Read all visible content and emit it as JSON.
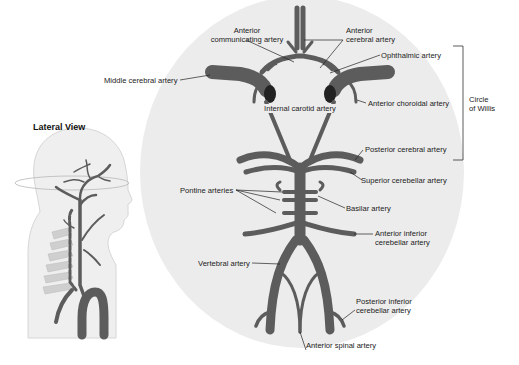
{
  "figure": {
    "lateral_view_title": "Lateral View",
    "bracket_label": [
      "Circle",
      "of Willis"
    ],
    "colors": {
      "artery": "#5c5c5c",
      "background_ellipse": "#ececec",
      "head_fill": "#efefef",
      "vertebrae": "#c8c8c8",
      "label_text": "#222222",
      "leader_line": "#222222"
    }
  },
  "labels": {
    "anterior_communicating": [
      "Anterior",
      "communicating artery"
    ],
    "anterior_cerebral": [
      "Anterior",
      "cerebral artery"
    ],
    "ophthalmic": "Ophthalmic artery",
    "middle_cerebral": "Middle cerebral artery",
    "anterior_choroidal": "Anterior choroidal artery",
    "internal_carotid": "Internal carotid artery",
    "posterior_cerebral": "Posterior cerebral artery",
    "superior_cerebellar": "Superior cerebellar artery",
    "pontine": "Pontine arteries",
    "basilar": "Basilar artery",
    "anterior_inferior_cerebellar": [
      "Anterior inferior",
      "cerebellar artery"
    ],
    "vertebral": "Vertebral artery",
    "posterior_inferior_cerebellar": [
      "Posterior inferior",
      "cerebellar artery"
    ],
    "anterior_spinal": "Anterior spinal artery"
  }
}
